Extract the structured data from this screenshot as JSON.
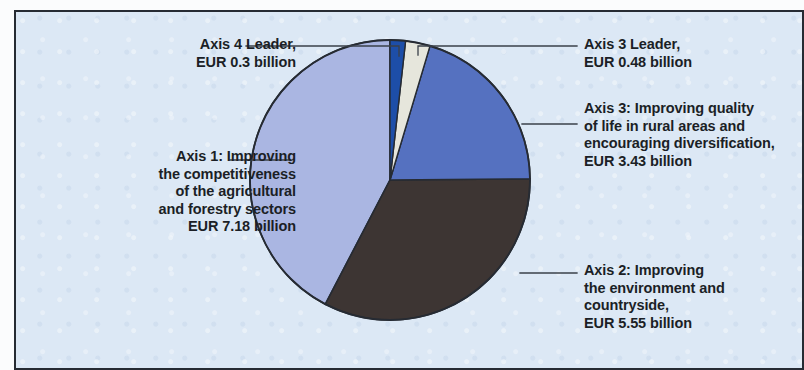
{
  "figure": {
    "background_color": "#dce8f5",
    "border_color": "#262b33",
    "text_color": "#1b1f26"
  },
  "chart_data": {
    "type": "pie",
    "title": "",
    "subtitle": "",
    "xlabel": "",
    "ylabel": "",
    "unit": "EUR billion",
    "legend_position": "callout-labels",
    "grid": false,
    "total": 16.94,
    "categories": [
      "Axis 4 Leader",
      "Axis 3 Leader",
      "Axis 3: Improving quality of life in rural areas and encouraging diversification",
      "Axis 2: Improving the environment and countryside",
      "Axis 1: Improving the competitiveness of the agricultural and forestry sectors"
    ],
    "values": [
      0.3,
      0.48,
      3.43,
      5.55,
      7.18
    ],
    "colors": [
      "#1d4ea8",
      "#e6e6dc",
      "#5571c0",
      "#3d3533",
      "#aab6e2"
    ],
    "slices": [
      {
        "name": "Axis 4 Leader",
        "value": 0.3,
        "value_text": "EUR 0.3 billion",
        "color": "#1d4ea8",
        "start_angle": 0,
        "end_angle": 6.4
      },
      {
        "name": "Axis 3 Leader",
        "value": 0.48,
        "value_text": "EUR 0.48 billion",
        "color": "#e6e6dc",
        "start_angle": 6.4,
        "end_angle": 16.6
      },
      {
        "name": "Axis 3",
        "value": 3.43,
        "value_text": "EUR 3.43 billion",
        "color": "#5571c0",
        "start_angle": 16.6,
        "end_angle": 89.5
      },
      {
        "name": "Axis 2",
        "value": 5.55,
        "value_text": "EUR 5.55 billion",
        "color": "#3d3533",
        "start_angle": 89.5,
        "end_angle": 207.5
      },
      {
        "name": "Axis 1",
        "value": 7.18,
        "value_text": "EUR 7.18 billion",
        "color": "#aab6e2",
        "start_angle": 207.5,
        "end_angle": 360
      }
    ]
  },
  "labels": {
    "axis4_leader": "Axis 4 Leader,\nEUR 0.3 billion",
    "axis3_leader": "Axis 3 Leader,\nEUR 0.48 billion",
    "axis3": "Axis 3: Improving quality\nof life in rural areas and\nencouraging diversification,\nEUR 3.43 billion",
    "axis2": "Axis 2: Improving\nthe environment and\ncountryside,\nEUR 5.55 billion",
    "axis1": "Axis 1: Improving\nthe competitiveness\nof the agricultural\nand forestry sectors\nEUR 7.18 billion"
  }
}
